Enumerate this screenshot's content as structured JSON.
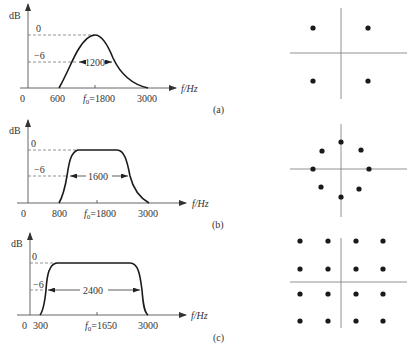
{
  "panels": [
    {
      "id": "a",
      "caption": "(a)",
      "y_axis_label": "dB",
      "x_axis_label": "f/Hz",
      "origin_label": "0",
      "level_0_label": "0",
      "level_6_label": "−6",
      "bandwidth_label": "1200",
      "tick_low": "600",
      "center_prefix": "f",
      "center_sub": "0",
      "center_value": "=1800",
      "tick_high": "3000",
      "shape": "raised-cosine (gaussian-like)",
      "constellation": "QPSK (4 points)"
    },
    {
      "id": "b",
      "caption": "(b)",
      "y_axis_label": "dB",
      "x_axis_label": "f/Hz",
      "origin_label": "0",
      "level_0_label": "0",
      "level_6_label": "−6",
      "bandwidth_label": "1600",
      "tick_low": "800",
      "center_prefix": "f",
      "center_sub": "0",
      "center_value": "=1800",
      "tick_high": "3000",
      "shape": "flat-top with moderate rolloff",
      "constellation": "8PSK (8 points on circle)"
    },
    {
      "id": "c",
      "caption": "(c)",
      "y_axis_label": "dB",
      "x_axis_label": "f/Hz",
      "origin_label": "0",
      "level_0_label": "0",
      "level_6_label": "−6",
      "bandwidth_label": "2400",
      "tick_low": "300",
      "center_prefix": "f",
      "center_sub": "0",
      "center_value": "=1650",
      "tick_high": "3000",
      "shape": "flat-top with sharp rolloff",
      "constellation": "16QAM (4x4 grid)"
    }
  ],
  "colors": {
    "curve": "#1a1a1a",
    "axis": "#555555",
    "dots": "#1a1a1a",
    "background": "#ffffff"
  }
}
